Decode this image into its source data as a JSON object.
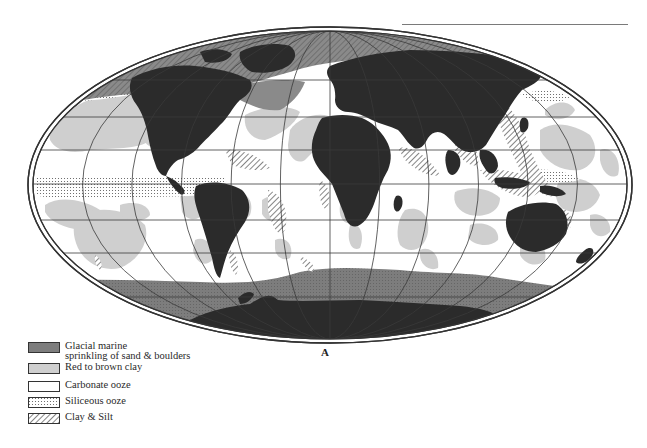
{
  "figure": {
    "panel_label": "A"
  },
  "legend": {
    "items": [
      {
        "label": "Glacial marine\nsprinkling of sand & boulders",
        "pattern": "dark-gray-stipple",
        "color": "#7d7d7d"
      },
      {
        "label": "Red to brown clay",
        "pattern": "light-gray",
        "color": "#cfcfcf"
      },
      {
        "label": "Carbonate ooze",
        "pattern": "white",
        "color": "#ffffff"
      },
      {
        "label": "Siliceous ooze",
        "pattern": "dotted",
        "color": "#ffffff"
      },
      {
        "label": "Clay & Silt",
        "pattern": "diagonal-hatch",
        "color": "#ffffff"
      }
    ]
  },
  "colors": {
    "land": "#2b2b2b",
    "glacial": "#7d7d7d",
    "red_clay": "#cfcfcf",
    "carbonate": "#ffffff",
    "outline": "#333333"
  }
}
